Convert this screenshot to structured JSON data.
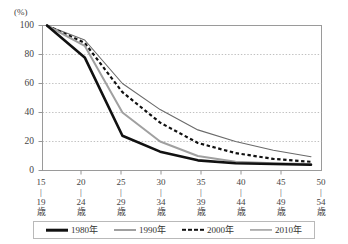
{
  "chart_data": {
    "type": "line",
    "title": "",
    "xlabel": "",
    "ylabel": "",
    "unit_label": "(%)",
    "ylim": [
      0,
      100
    ],
    "yticks": [
      "0",
      "20",
      "40",
      "60",
      "80",
      "100"
    ],
    "grid": true,
    "legend_position": "bottom",
    "categories": [
      "15\n|\n19\n歳",
      "20\n|\n24\n歳",
      "25\n|\n29\n歳",
      "30\n|\n34\n歳",
      "35\n|\n39\n歳",
      "40\n|\n44\n歳",
      "45\n|\n49\n歳",
      "50\n|\n54\n歳"
    ],
    "category_parts": [
      {
        "from": "15",
        "dash": "|",
        "to": "19",
        "suffix": "歳"
      },
      {
        "from": "20",
        "dash": "|",
        "to": "24",
        "suffix": "歳"
      },
      {
        "from": "25",
        "dash": "|",
        "to": "29",
        "suffix": "歳"
      },
      {
        "from": "30",
        "dash": "|",
        "to": "34",
        "suffix": "歳"
      },
      {
        "from": "35",
        "dash": "|",
        "to": "39",
        "suffix": "歳"
      },
      {
        "from": "40",
        "dash": "|",
        "to": "44",
        "suffix": "歳"
      },
      {
        "from": "45",
        "dash": "|",
        "to": "49",
        "suffix": "歳"
      },
      {
        "from": "50",
        "dash": "|",
        "to": "54",
        "suffix": "歳"
      }
    ],
    "series": [
      {
        "name": "1980年",
        "color": "#111111",
        "style": "solid",
        "width": 2.6,
        "values": [
          100,
          78,
          24,
          13,
          7,
          5,
          4.5,
          4
        ]
      },
      {
        "name": "1990年",
        "color": "#a0a0a0",
        "style": "solid",
        "width": 2.0,
        "values": [
          100,
          86,
          40,
          20,
          10,
          6,
          5,
          4.5
        ]
      },
      {
        "name": "2000年",
        "color": "#111111",
        "style": "dashed",
        "width": 2.2,
        "values": [
          100,
          88,
          54,
          33,
          19,
          12,
          8,
          6
        ]
      },
      {
        "name": "2010年",
        "color": "#6a6a6a",
        "style": "solid",
        "width": 1.1,
        "values": [
          100,
          90,
          60,
          42,
          28,
          20,
          14,
          9.5
        ]
      }
    ]
  },
  "legend": {
    "items": [
      {
        "label": "1980年"
      },
      {
        "label": "1990年"
      },
      {
        "label": "2000年"
      },
      {
        "label": "2010年"
      }
    ]
  }
}
